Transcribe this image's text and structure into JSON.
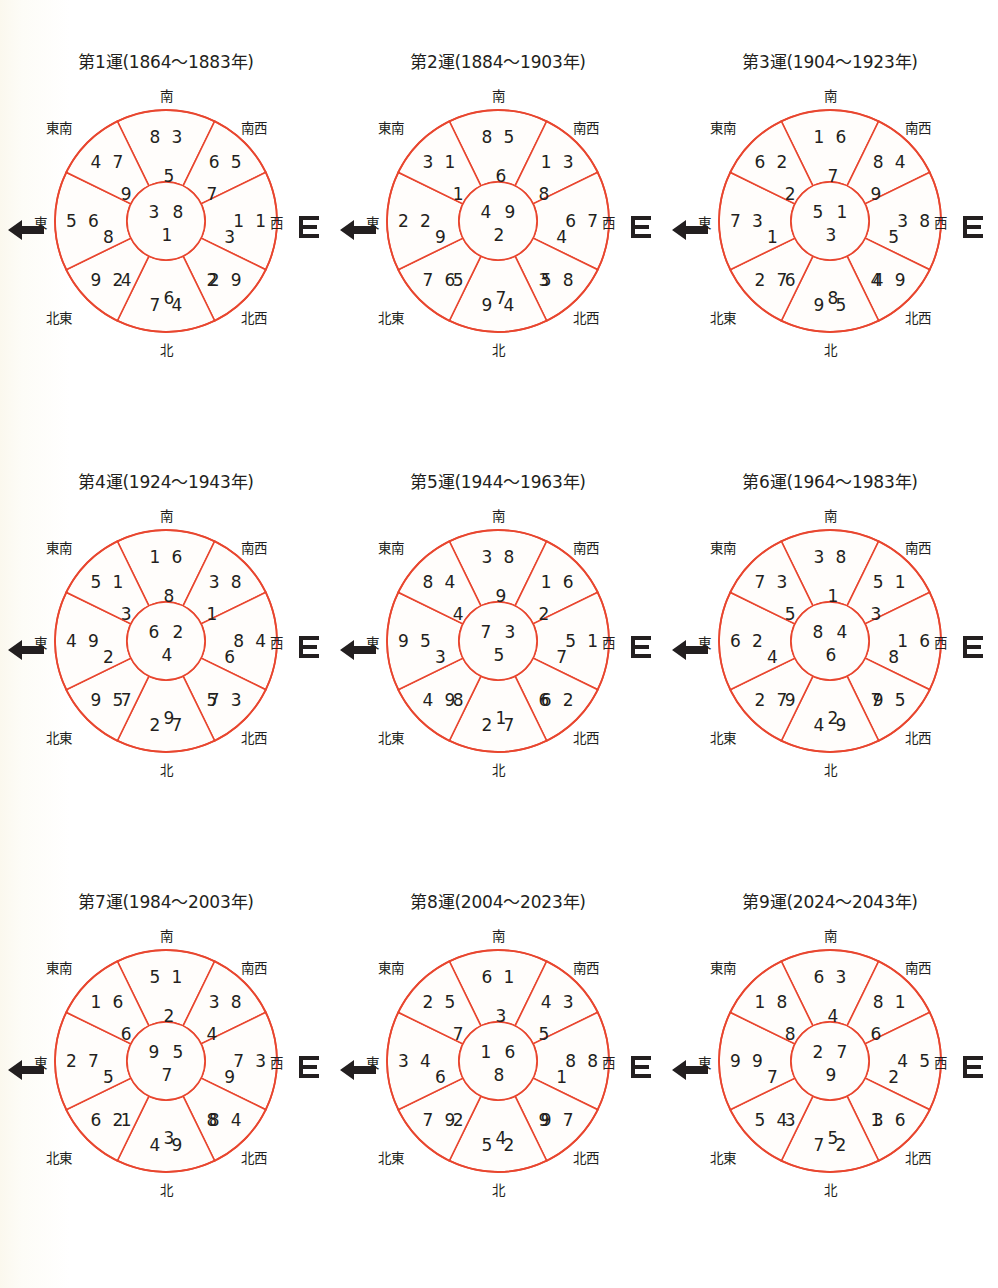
{
  "page": {
    "accent_color": "#e8462f",
    "text_color": "#231f20",
    "background_color": "#ffffff"
  },
  "directions": {
    "north": "北",
    "south": "南",
    "east": "東",
    "west": "西",
    "southeast": "東南",
    "southwest": "南西",
    "northeast": "北東",
    "northwest": "北西"
  },
  "charts": [
    {
      "id": "chart-1",
      "title": "第1運(1864〜1883年)",
      "period": "1",
      "year_start": "1864",
      "year_end": "1883",
      "center": {
        "top_left": "3",
        "top_right": "8",
        "bottom": "1"
      },
      "sectors": {
        "south": {
          "top_left": "8",
          "top_right": "3",
          "bottom": "5"
        },
        "southwest": {
          "top_left": "6",
          "top_right": "5",
          "bottom": "7"
        },
        "west": {
          "top_left": "1",
          "top_right": "1",
          "bottom": "3"
        },
        "northwest": {
          "top_left": "2",
          "top_right": "9",
          "bottom": "2"
        },
        "north": {
          "top_left": "7",
          "top_right": "4",
          "bottom": "6"
        },
        "northeast": {
          "top_left": "9",
          "top_right": "2",
          "bottom": "4"
        },
        "east": {
          "top_left": "5",
          "top_right": "6",
          "bottom": "8"
        },
        "southeast": {
          "top_left": "4",
          "top_right": "7",
          "bottom": "9"
        }
      }
    },
    {
      "id": "chart-2",
      "title": "第2運(1884〜1903年)",
      "period": "2",
      "year_start": "1884",
      "year_end": "1903",
      "center": {
        "top_left": "4",
        "top_right": "9",
        "bottom": "2"
      },
      "sectors": {
        "south": {
          "top_left": "8",
          "top_right": "5",
          "bottom": "6"
        },
        "southwest": {
          "top_left": "1",
          "top_right": "3",
          "bottom": "8"
        },
        "west": {
          "top_left": "6",
          "top_right": "7",
          "bottom": "4"
        },
        "northwest": {
          "top_left": "5",
          "top_right": "8",
          "bottom": "3"
        },
        "north": {
          "top_left": "9",
          "top_right": "4",
          "bottom": "7"
        },
        "northeast": {
          "top_left": "7",
          "top_right": "6",
          "bottom": "5"
        },
        "east": {
          "top_left": "2",
          "top_right": "2",
          "bottom": "9"
        },
        "southeast": {
          "top_left": "3",
          "top_right": "1",
          "bottom": "1"
        }
      }
    },
    {
      "id": "chart-3",
      "title": "第3運(1904〜1923年)",
      "period": "3",
      "year_start": "1904",
      "year_end": "1923",
      "center": {
        "top_left": "5",
        "top_right": "1",
        "bottom": "3"
      },
      "sectors": {
        "south": {
          "top_left": "1",
          "top_right": "6",
          "bottom": "7"
        },
        "southwest": {
          "top_left": "8",
          "top_right": "4",
          "bottom": "9"
        },
        "west": {
          "top_left": "3",
          "top_right": "8",
          "bottom": "5"
        },
        "northwest": {
          "top_left": "4",
          "top_right": "9",
          "bottom": "4"
        },
        "north": {
          "top_left": "9",
          "top_right": "5",
          "bottom": "8"
        },
        "northeast": {
          "top_left": "2",
          "top_right": "7",
          "bottom": "6"
        },
        "east": {
          "top_left": "7",
          "top_right": "3",
          "bottom": "1"
        },
        "southeast": {
          "top_left": "6",
          "top_right": "2",
          "bottom": "2"
        }
      }
    },
    {
      "id": "chart-4",
      "title": "第4運(1924〜1943年)",
      "period": "4",
      "year_start": "1924",
      "year_end": "1943",
      "center": {
        "top_left": "6",
        "top_right": "2",
        "bottom": "4"
      },
      "sectors": {
        "south": {
          "top_left": "1",
          "top_right": "6",
          "bottom": "8"
        },
        "southwest": {
          "top_left": "3",
          "top_right": "8",
          "bottom": "1"
        },
        "west": {
          "top_left": "8",
          "top_right": "4",
          "bottom": "6"
        },
        "northwest": {
          "top_left": "7",
          "top_right": "3",
          "bottom": "5"
        },
        "north": {
          "top_left": "2",
          "top_right": "7",
          "bottom": "9"
        },
        "northeast": {
          "top_left": "9",
          "top_right": "5",
          "bottom": "7"
        },
        "east": {
          "top_left": "4",
          "top_right": "9",
          "bottom": "2"
        },
        "southeast": {
          "top_left": "5",
          "top_right": "1",
          "bottom": "3"
        }
      }
    },
    {
      "id": "chart-5",
      "title": "第5運(1944〜1963年)",
      "period": "5",
      "year_start": "1944",
      "year_end": "1963",
      "center": {
        "top_left": "7",
        "top_right": "3",
        "bottom": "5"
      },
      "sectors": {
        "south": {
          "top_left": "3",
          "top_right": "8",
          "bottom": "9"
        },
        "southwest": {
          "top_left": "1",
          "top_right": "6",
          "bottom": "2"
        },
        "west": {
          "top_left": "5",
          "top_right": "1",
          "bottom": "7"
        },
        "northwest": {
          "top_left": "6",
          "top_right": "2",
          "bottom": "6"
        },
        "north": {
          "top_left": "2",
          "top_right": "7",
          "bottom": "1"
        },
        "northeast": {
          "top_left": "4",
          "top_right": "9",
          "bottom": "8"
        },
        "east": {
          "top_left": "9",
          "top_right": "5",
          "bottom": "3"
        },
        "southeast": {
          "top_left": "8",
          "top_right": "4",
          "bottom": "4"
        }
      }
    },
    {
      "id": "chart-6",
      "title": "第6運(1964〜1983年)",
      "period": "6",
      "year_start": "1964",
      "year_end": "1983",
      "center": {
        "top_left": "8",
        "top_right": "4",
        "bottom": "6"
      },
      "sectors": {
        "south": {
          "top_left": "3",
          "top_right": "8",
          "bottom": "1"
        },
        "southwest": {
          "top_left": "5",
          "top_right": "1",
          "bottom": "3"
        },
        "west": {
          "top_left": "1",
          "top_right": "6",
          "bottom": "8"
        },
        "northwest": {
          "top_left": "9",
          "top_right": "5",
          "bottom": "7"
        },
        "north": {
          "top_left": "4",
          "top_right": "9",
          "bottom": "2"
        },
        "northeast": {
          "top_left": "2",
          "top_right": "7",
          "bottom": "9"
        },
        "east": {
          "top_left": "6",
          "top_right": "2",
          "bottom": "4"
        },
        "southeast": {
          "top_left": "7",
          "top_right": "3",
          "bottom": "5"
        }
      }
    },
    {
      "id": "chart-7",
      "title": "第7運(1984〜2003年)",
      "period": "7",
      "year_start": "1984",
      "year_end": "2003",
      "center": {
        "top_left": "9",
        "top_right": "5",
        "bottom": "7"
      },
      "sectors": {
        "south": {
          "top_left": "5",
          "top_right": "1",
          "bottom": "2"
        },
        "southwest": {
          "top_left": "3",
          "top_right": "8",
          "bottom": "4"
        },
        "west": {
          "top_left": "7",
          "top_right": "3",
          "bottom": "9"
        },
        "northwest": {
          "top_left": "8",
          "top_right": "4",
          "bottom": "8"
        },
        "north": {
          "top_left": "4",
          "top_right": "9",
          "bottom": "3"
        },
        "northeast": {
          "top_left": "6",
          "top_right": "2",
          "bottom": "1"
        },
        "east": {
          "top_left": "2",
          "top_right": "7",
          "bottom": "5"
        },
        "southeast": {
          "top_left": "1",
          "top_right": "6",
          "bottom": "6"
        }
      }
    },
    {
      "id": "chart-8",
      "title": "第8運(2004〜2023年)",
      "period": "8",
      "year_start": "2004",
      "year_end": "2023",
      "center": {
        "top_left": "1",
        "top_right": "6",
        "bottom": "8"
      },
      "sectors": {
        "south": {
          "top_left": "6",
          "top_right": "1",
          "bottom": "3"
        },
        "southwest": {
          "top_left": "4",
          "top_right": "3",
          "bottom": "5"
        },
        "west": {
          "top_left": "8",
          "top_right": "8",
          "bottom": "1"
        },
        "northwest": {
          "top_left": "9",
          "top_right": "7",
          "bottom": "9"
        },
        "north": {
          "top_left": "5",
          "top_right": "2",
          "bottom": "4"
        },
        "northeast": {
          "top_left": "7",
          "top_right": "9",
          "bottom": "2"
        },
        "east": {
          "top_left": "3",
          "top_right": "4",
          "bottom": "6"
        },
        "southeast": {
          "top_left": "2",
          "top_right": "5",
          "bottom": "7"
        }
      }
    },
    {
      "id": "chart-9",
      "title": "第9運(2024〜2043年)",
      "period": "9",
      "year_start": "2024",
      "year_end": "2043",
      "center": {
        "top_left": "2",
        "top_right": "7",
        "bottom": "9"
      },
      "sectors": {
        "south": {
          "top_left": "6",
          "top_right": "3",
          "bottom": "4"
        },
        "southwest": {
          "top_left": "8",
          "top_right": "1",
          "bottom": "6"
        },
        "west": {
          "top_left": "4",
          "top_right": "5",
          "bottom": "2"
        },
        "northwest": {
          "top_left": "3",
          "top_right": "6",
          "bottom": "1"
        },
        "north": {
          "top_left": "7",
          "top_right": "2",
          "bottom": "5"
        },
        "northeast": {
          "top_left": "5",
          "top_right": "4",
          "bottom": "3"
        },
        "east": {
          "top_left": "9",
          "top_right": "9",
          "bottom": "7"
        },
        "southeast": {
          "top_left": "1",
          "top_right": "8",
          "bottom": "8"
        }
      }
    }
  ]
}
